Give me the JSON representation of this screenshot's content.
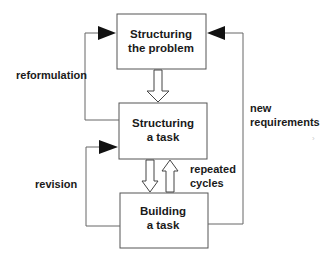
{
  "diagram": {
    "nodes": [
      {
        "id": "structuring-problem",
        "lines": [
          "Structuring",
          "the problem"
        ]
      },
      {
        "id": "structuring-task",
        "lines": [
          "Structuring",
          "a task"
        ]
      },
      {
        "id": "building-task",
        "lines": [
          "Building",
          "a task"
        ]
      }
    ],
    "edges": [
      {
        "from": "structuring-problem",
        "to": "structuring-task",
        "style": "hollow-arrow"
      },
      {
        "from": "structuring-task",
        "to": "building-task",
        "style": "hollow-arrow"
      },
      {
        "from": "building-task",
        "to": "structuring-task",
        "style": "hollow-arrow",
        "label": "repeated cycles"
      },
      {
        "from": "structuring-task",
        "to": "structuring-problem",
        "style": "loop-left",
        "label": "reformulation"
      },
      {
        "from": "building-task",
        "to": "structuring-task",
        "style": "loop-left",
        "label": "revision"
      },
      {
        "from": "building-task",
        "to": "structuring-problem",
        "style": "loop-right",
        "label": "new requirements"
      }
    ],
    "labels": {
      "reformulation": "reformulation",
      "revision": "revision",
      "repeated_1": "repeated",
      "repeated_2": "cycles",
      "newreq_1": "new",
      "newreq_2": "requirements"
    }
  }
}
